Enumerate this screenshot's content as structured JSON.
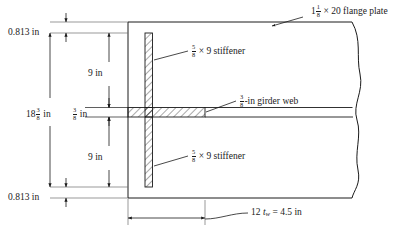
{
  "figure": {
    "type": "engineering-section-drawing",
    "units": "in",
    "stroke_color": "#1a1a1a",
    "background_color": "#ffffff"
  },
  "labels": {
    "flange_plate": {
      "whole": "1",
      "frac_num": "1",
      "frac_den": "8",
      "rest": "× 20 flange plate"
    },
    "stiffener_top": {
      "frac_num": "5",
      "frac_den": "8",
      "rest": "× 9 stiffener"
    },
    "stiffener_bottom": {
      "frac_num": "5",
      "frac_den": "8",
      "rest": "× 9 stiffener"
    },
    "girder_web": {
      "frac_num": "3",
      "frac_den": "8",
      "rest": "-in girder web"
    },
    "bottom_dim": {
      "prefix": "12",
      "symbol": "t",
      "subscript": "w",
      "value": "= 4.5 in"
    }
  },
  "dimensions": {
    "top_edge_distance": "0.813 in",
    "bottom_edge_distance": "0.813 in",
    "upper_clear_depth": "9 in",
    "lower_clear_depth": "9 in",
    "overall_depth": {
      "whole": "18",
      "frac_num": "3",
      "frac_den": "8",
      "unit": "in"
    },
    "web_thickness_dim": {
      "frac_num": "3",
      "frac_den": "8",
      "unit": "in"
    }
  },
  "geometry": {
    "web_outline": {
      "left": 128,
      "top": 22,
      "bottom": 198,
      "break_x": 360
    },
    "stiffener": {
      "x1": 145,
      "x2": 152.5,
      "top": 33,
      "bottom": 187
    },
    "web_band": {
      "top": 107,
      "bottom": 117,
      "right": 205
    },
    "dim_extension_left": 22,
    "bottom_dim_line_y": 217
  }
}
